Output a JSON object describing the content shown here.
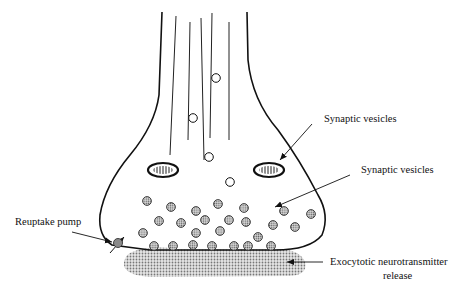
{
  "diagram": {
    "labels": {
      "synaptic_vesicles_top": "Synaptic vesicles",
      "synaptic_vesicles_mid": "Synaptic vesicles",
      "reuptake_pump": "Reuptake pump",
      "exocytotic_line1": "Exocytotic neurotransmitter",
      "exocytotic_line2": "release"
    },
    "colors": {
      "outline": "#111111",
      "vesicle_fill": "#b8b8b8",
      "pump_fill": "#8a8a8a",
      "cleft_fill": "#c8c8c8"
    },
    "elements": {
      "microtubules": 5,
      "empty_vesicles": 4,
      "filled_vesicles": 18,
      "docked_vesicles": 7,
      "mitochondria": 2
    }
  }
}
